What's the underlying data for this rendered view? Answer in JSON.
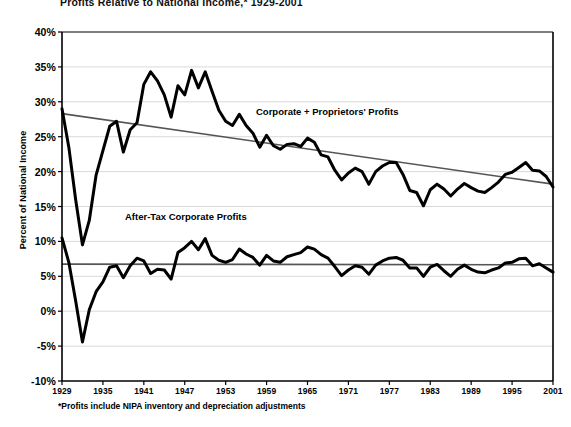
{
  "chart_data": {
    "type": "line",
    "title": "Profits Relative to National Income,* 1929-2001",
    "xlabel": "",
    "ylabel": "Percent of National Income",
    "footnote": "*Profits include NIPA inventory and depreciation adjustments",
    "xlim": [
      1929,
      2001
    ],
    "ylim": [
      -10,
      40
    ],
    "ytick_labels": [
      "40%",
      "35%",
      "30%",
      "25%",
      "20%",
      "15%",
      "10%",
      "5%",
      "0%",
      "-5%",
      "-10%"
    ],
    "ytick_values": [
      40,
      35,
      30,
      25,
      20,
      15,
      10,
      5,
      0,
      -5,
      -10
    ],
    "xtick_labels": [
      "1929",
      "1935",
      "1941",
      "1947",
      "1953",
      "1959",
      "1965",
      "1971",
      "1977",
      "1983",
      "1989",
      "1995",
      "2001"
    ],
    "xtick_values": [
      1929,
      1935,
      1941,
      1947,
      1953,
      1959,
      1965,
      1971,
      1977,
      1983,
      1989,
      1995,
      2001
    ],
    "grid": true,
    "legend_position": "inline-annotations",
    "colors": {
      "series_line": "#000000",
      "trend_line": "#555555",
      "gridline": "#d9d9d9",
      "axis": "#000000",
      "background": "#ffffff"
    },
    "x": [
      1929,
      1930,
      1931,
      1932,
      1933,
      1934,
      1935,
      1936,
      1937,
      1938,
      1939,
      1940,
      1941,
      1942,
      1943,
      1944,
      1945,
      1946,
      1947,
      1948,
      1949,
      1950,
      1951,
      1952,
      1953,
      1954,
      1955,
      1956,
      1957,
      1958,
      1959,
      1960,
      1961,
      1962,
      1963,
      1964,
      1965,
      1966,
      1967,
      1968,
      1969,
      1970,
      1971,
      1972,
      1973,
      1974,
      1975,
      1976,
      1977,
      1978,
      1979,
      1980,
      1981,
      1982,
      1983,
      1984,
      1985,
      1986,
      1987,
      1988,
      1989,
      1990,
      1991,
      1992,
      1993,
      1994,
      1995,
      1996,
      1997,
      1998,
      1999,
      2000,
      2001
    ],
    "series": [
      {
        "name": "Corporate + Proprietors' Profits",
        "label_text": "Corporate + Proprietors' Profits",
        "values": [
          29.0,
          23.5,
          16.0,
          9.5,
          13.0,
          19.5,
          23.0,
          26.5,
          27.2,
          22.8,
          26.0,
          27.0,
          32.5,
          34.3,
          33.0,
          31.0,
          27.8,
          32.3,
          31.0,
          34.5,
          32.0,
          34.3,
          31.5,
          28.8,
          27.2,
          26.6,
          28.2,
          26.6,
          25.5,
          23.5,
          25.2,
          23.7,
          23.2,
          23.9,
          24.0,
          23.6,
          24.8,
          24.2,
          22.4,
          22.1,
          20.2,
          18.8,
          19.8,
          20.5,
          20.0,
          18.2,
          20.0,
          20.8,
          21.3,
          21.3,
          19.6,
          17.3,
          17.0,
          15.1,
          17.4,
          18.2,
          17.5,
          16.5,
          17.5,
          18.3,
          17.7,
          17.2,
          17.0,
          17.7,
          18.5,
          19.6,
          19.9,
          20.6,
          21.3,
          20.2,
          20.1,
          19.3,
          17.8
        ]
      },
      {
        "name": "After-Tax Corporate Profits",
        "label_text": "After-Tax Corporate Profits",
        "values": [
          10.5,
          7.0,
          1.5,
          -4.4,
          0.2,
          2.8,
          4.2,
          6.3,
          6.5,
          4.8,
          6.5,
          7.6,
          7.2,
          5.4,
          6.0,
          5.9,
          4.6,
          8.4,
          9.1,
          10.0,
          8.8,
          10.4,
          8.0,
          7.3,
          7.0,
          7.4,
          8.9,
          8.2,
          7.7,
          6.6,
          8.0,
          7.2,
          7.0,
          7.8,
          8.1,
          8.4,
          9.2,
          8.9,
          8.1,
          7.6,
          6.4,
          5.1,
          5.9,
          6.5,
          6.3,
          5.3,
          6.6,
          7.2,
          7.6,
          7.7,
          7.3,
          6.2,
          6.2,
          5.0,
          6.3,
          6.7,
          5.8,
          5.0,
          6.0,
          6.6,
          6.0,
          5.6,
          5.5,
          5.9,
          6.2,
          6.9,
          7.0,
          7.5,
          7.6,
          6.5,
          6.8,
          6.2,
          5.6
        ]
      }
    ],
    "trend_lines": [
      {
        "name": "upper-trend",
        "for_series": "Corporate + Proprietors' Profits",
        "start": {
          "x": 1929,
          "y": 28.3
        },
        "end": {
          "x": 2001,
          "y": 18.2
        }
      },
      {
        "name": "lower-trend",
        "for_series": "After-Tax Corporate Profits",
        "start": {
          "x": 1929,
          "y": 6.75
        },
        "end": {
          "x": 2001,
          "y": 6.65
        }
      }
    ]
  }
}
